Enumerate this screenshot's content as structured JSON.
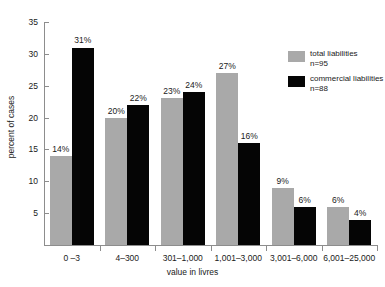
{
  "chart_data": {
    "type": "bar",
    "title": "",
    "xlabel": "value in livres",
    "ylabel": "percent of cases",
    "categories": [
      "0 –3",
      "4–300",
      "301–1,000",
      "1,001–3,000",
      "3,001–6,000",
      "6,001–25,000"
    ],
    "series": [
      {
        "name": "total liabilities",
        "n_label": "n=95",
        "color": "#a9a9a9",
        "values": [
          14,
          20,
          23,
          27,
          9,
          6
        ],
        "labels": [
          "14%",
          "20%",
          "23%",
          "27%",
          "9%",
          "6%"
        ]
      },
      {
        "name": "commercial liabilities",
        "n_label": "n=88",
        "color": "#050505",
        "values": [
          31,
          22,
          24,
          16,
          6,
          4
        ],
        "labels": [
          "31%",
          "22%",
          "24%",
          "16%",
          "6%",
          "4%"
        ]
      }
    ],
    "ylim": [
      0,
      35
    ],
    "yticks": [
      5,
      10,
      15,
      20,
      25,
      30,
      35
    ],
    "ytick_labels": [
      "5",
      "10",
      "15",
      "20",
      "25",
      "30",
      "35"
    ],
    "grid": false,
    "legend_position": "upper-right-inside"
  },
  "axes": {
    "y_title": "percent of cases",
    "x_title": "value in livres"
  },
  "legend": {
    "entries": [
      {
        "label": "total liabilities",
        "n": "n=95"
      },
      {
        "label": "commercial liabilities",
        "n": "n=88"
      }
    ]
  }
}
